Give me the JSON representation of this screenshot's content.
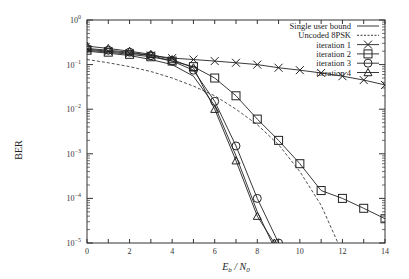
{
  "chart_data": {
    "type": "line",
    "title": "",
    "xlabel": "E_b / N_0",
    "ylabel": "BER",
    "xlim": [
      0,
      14
    ],
    "ylim": [
      1e-05,
      1
    ],
    "yscale": "log",
    "grid": false,
    "legend_position": "top-right",
    "x_ticks": [
      "0",
      "2",
      "4",
      "6",
      "8",
      "10",
      "12",
      "14"
    ],
    "y_ticks": [
      "10^0",
      "10^-1",
      "10^-2",
      "10^-3",
      "10^-4",
      "10^-5"
    ],
    "series": [
      {
        "name": "Single user bound",
        "style": "solid",
        "marker": "none",
        "x": [
          0,
          1,
          2,
          3,
          4,
          5,
          6,
          7,
          8,
          8.7
        ],
        "values": [
          0.2,
          0.18,
          0.16,
          0.13,
          0.1,
          0.055,
          0.012,
          0.0009,
          5e-05,
          1e-05
        ]
      },
      {
        "name": "Uncoded 8PSK",
        "style": "dashed",
        "marker": "none",
        "x": [
          0,
          1,
          2,
          3,
          4,
          5,
          6,
          7,
          8,
          9,
          10,
          11,
          12,
          13
        ],
        "values": [
          0.13,
          0.11,
          0.09,
          0.07,
          0.05,
          0.033,
          0.02,
          0.01,
          0.0045,
          0.0016,
          0.0004,
          7e-05,
          6e-06,
          1e-05
        ]
      },
      {
        "name": "iteration 1",
        "style": "solid",
        "marker": "x",
        "x": [
          0,
          1,
          2,
          3,
          4,
          5,
          6,
          7,
          8,
          9,
          10,
          11,
          12,
          13,
          14
        ],
        "values": [
          0.22,
          0.2,
          0.18,
          0.16,
          0.14,
          0.13,
          0.12,
          0.11,
          0.1,
          0.085,
          0.075,
          0.065,
          0.055,
          0.045,
          0.035
        ]
      },
      {
        "name": "iteration 2",
        "style": "solid",
        "marker": "square",
        "x": [
          0,
          1,
          2,
          3,
          4,
          5,
          6,
          7,
          8,
          9,
          10,
          11,
          12,
          13,
          14
        ],
        "values": [
          0.21,
          0.19,
          0.17,
          0.15,
          0.12,
          0.09,
          0.05,
          0.02,
          0.006,
          0.002,
          0.0006,
          0.00015,
          0.0001,
          6e-05,
          3.5e-05
        ]
      },
      {
        "name": "iteration 3",
        "style": "solid",
        "marker": "circle",
        "x": [
          0,
          1,
          2,
          3,
          4,
          5,
          6,
          7,
          8,
          9
        ],
        "values": [
          0.23,
          0.21,
          0.19,
          0.16,
          0.12,
          0.075,
          0.015,
          0.0015,
          0.0001,
          1e-05
        ]
      },
      {
        "name": "iteration 4",
        "style": "solid",
        "marker": "triangle",
        "x": [
          0,
          1,
          2,
          3,
          4,
          5,
          6,
          7,
          8,
          8.8
        ],
        "values": [
          0.26,
          0.23,
          0.2,
          0.17,
          0.13,
          0.085,
          0.01,
          0.0007,
          4e-05,
          1e-05
        ]
      }
    ]
  },
  "legend": {
    "items": [
      {
        "label": "Single user bound"
      },
      {
        "label": "Uncoded 8PSK"
      },
      {
        "label": "iteration 1"
      },
      {
        "label": "iteration 2"
      },
      {
        "label": "iteration 3"
      },
      {
        "label": "iteration 4"
      }
    ]
  },
  "axes": {
    "xlabel_main": "E",
    "xlabel_sub1": "b",
    "xlabel_mid": " / N",
    "xlabel_sub2": "0",
    "ylabel": "BER"
  }
}
